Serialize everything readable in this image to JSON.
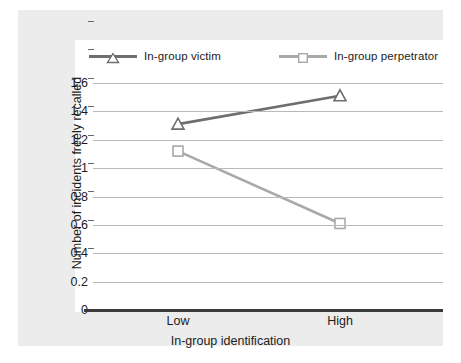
{
  "chart_data": {
    "type": "line",
    "title": "",
    "xlabel": "In-group identification",
    "ylabel": "Number of incidents freely recalled",
    "categories": [
      "Low",
      "High"
    ],
    "x": [
      0,
      1
    ],
    "ylim": [
      0,
      1.6
    ],
    "ytick_values": [
      0,
      0.2,
      0.4,
      0.6,
      0.8,
      1,
      1.2,
      1.4,
      1.6
    ],
    "ytick_labels": [
      "0",
      "0.2",
      "0.4",
      "0.6",
      "0.8",
      "1",
      "1.2",
      "1.4",
      "1.6"
    ],
    "grid": "horizontal",
    "legend_position": "top",
    "series": [
      {
        "name": "In-group victim",
        "values": [
          1.31,
          1.51
        ],
        "color": "#6e6e6e",
        "marker": "triangle-up-open"
      },
      {
        "name": "In-group perpetrator",
        "values": [
          1.12,
          0.61
        ],
        "color": "#a9a9a9",
        "marker": "square-open"
      }
    ]
  },
  "legend": {
    "items": [
      {
        "label": "In-group victim",
        "marker_icon": "triangle-marker-icon"
      },
      {
        "label": "In-group perpetrator",
        "marker_icon": "square-marker-icon"
      }
    ]
  },
  "colors": {
    "panel_background": "#ececec",
    "plot_background": "#ffffff",
    "gridline": "#b9b9b9",
    "axis": "#3a3a3a",
    "text": "#1c1c1c",
    "series_victim": "#6e6e6e",
    "series_perpetrator": "#a9a9a9"
  }
}
